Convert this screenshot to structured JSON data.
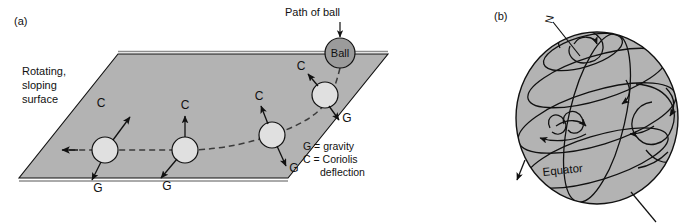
{
  "figure": {
    "panels": [
      {
        "id": "a",
        "tag": "(a)",
        "surface_label_lines": [
          "Rotating,",
          "sloping",
          "surface"
        ],
        "path_label": "Path of ball",
        "ball_label": "Ball",
        "vector_labels": {
          "coriolis": "C",
          "gravity": "G"
        },
        "key_lines": [
          "G = gravity",
          "C = Coriolis",
          "deflection"
        ],
        "key": {
          "gravity": "G = gravity",
          "coriolis": "C = Coriolis",
          "coriolis_cont": "deflection"
        },
        "ball_positions": [
          {
            "cx": 105,
            "cy": 150,
            "r": 13,
            "c_label_x": 132,
            "c_label_y": 104,
            "g_label_x": 92,
            "g_label_y": 188
          },
          {
            "cx": 185,
            "cy": 150,
            "r": 13,
            "c_label_x": 182,
            "c_label_y": 104,
            "g_label_x": 152,
            "g_label_y": 188
          },
          {
            "cx": 272,
            "cy": 135,
            "r": 13,
            "c_label_x": 258,
            "c_label_y": 92,
            "g_label_x": 288,
            "g_label_y": 178
          },
          {
            "cx": 325,
            "cy": 95,
            "r": 13,
            "c_label_x": 303,
            "c_label_y": 63,
            "g_label_x": 345,
            "g_label_y": 124
          }
        ],
        "launch_ball": {
          "cx": 340,
          "cy": 53,
          "r": 15
        }
      },
      {
        "id": "b",
        "tag": "(b)",
        "north_label": "N",
        "equator_label": "Equator",
        "globe": {
          "cx": 597,
          "cy": 118,
          "rx": 81,
          "ry": 86
        }
      }
    ],
    "colors": {
      "surface_fill": "#b3b3b3",
      "globe_fill": "#b3b3b3",
      "ball_fill": "#e0e0e0",
      "launch_ball_fill": "#9b9b9b",
      "stroke": "#111111",
      "background": "#ffffff"
    }
  }
}
